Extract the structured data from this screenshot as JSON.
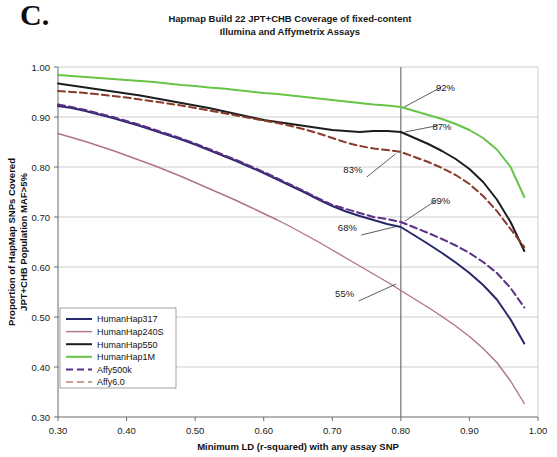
{
  "panel_letter": "C.",
  "chart_data": {
    "type": "line",
    "title": "Hapmap Build 22 JPT+CHB Coverage of fixed-content Illumina and Affymetrix Assays",
    "title_lines": [
      "Hapmap Build 22 JPT+CHB Coverage of fixed-content",
      "Illumina and Affymetrix Assays"
    ],
    "xlabel": "Minimum LD (r-squared) with any assay SNP",
    "ylabel": "Proportion of HapMap SNPs Covered JPT+CHB Population MAF>5%",
    "ylabel_lines": [
      "Proportion of HapMap SNPs Covered",
      "JPT+CHB Population MAF>5%"
    ],
    "xlim": [
      0.3,
      1.0
    ],
    "ylim": [
      0.3,
      1.0
    ],
    "xticks": [
      0.3,
      0.4,
      0.5,
      0.6,
      0.7,
      0.8,
      0.9,
      1.0
    ],
    "yticks": [
      0.3,
      0.4,
      0.5,
      0.6,
      0.7,
      0.8,
      0.9,
      1.0
    ],
    "xtick_labels": [
      "0.30",
      "0.40",
      "0.50",
      "0.60",
      "0.70",
      "0.80",
      "0.90",
      "1.00"
    ],
    "ytick_labels": [
      "0.30",
      "0.40",
      "0.50",
      "0.60",
      "0.70",
      "0.80",
      "0.90",
      "1.00"
    ],
    "grid": "horizontal",
    "legend_position": "lower-left",
    "reference_line": {
      "axis": "x",
      "value": 0.8,
      "color": "#555555"
    },
    "series": [
      {
        "name": "HumanHap317",
        "color": "#27276b",
        "style": "solid",
        "width": 2.0,
        "x": [
          0.3,
          0.32,
          0.34,
          0.36,
          0.38,
          0.4,
          0.42,
          0.44,
          0.46,
          0.48,
          0.5,
          0.52,
          0.54,
          0.56,
          0.58,
          0.6,
          0.62,
          0.64,
          0.66,
          0.68,
          0.7,
          0.72,
          0.74,
          0.76,
          0.78,
          0.8,
          0.82,
          0.84,
          0.86,
          0.88,
          0.9,
          0.92,
          0.94,
          0.96,
          0.98
        ],
        "y": [
          0.922,
          0.918,
          0.912,
          0.905,
          0.898,
          0.89,
          0.882,
          0.873,
          0.864,
          0.855,
          0.845,
          0.834,
          0.823,
          0.812,
          0.8,
          0.788,
          0.775,
          0.762,
          0.749,
          0.735,
          0.722,
          0.711,
          0.702,
          0.694,
          0.686,
          0.68,
          0.663,
          0.646,
          0.628,
          0.609,
          0.588,
          0.564,
          0.535,
          0.495,
          0.447
        ]
      },
      {
        "name": "HumanHap240S",
        "color": "#b0718f",
        "style": "solid",
        "width": 1.4,
        "x": [
          0.3,
          0.32,
          0.34,
          0.36,
          0.38,
          0.4,
          0.42,
          0.44,
          0.46,
          0.48,
          0.5,
          0.52,
          0.54,
          0.56,
          0.58,
          0.6,
          0.62,
          0.64,
          0.66,
          0.68,
          0.7,
          0.72,
          0.74,
          0.76,
          0.78,
          0.8,
          0.82,
          0.84,
          0.86,
          0.88,
          0.9,
          0.92,
          0.94,
          0.96,
          0.98
        ],
        "y": [
          0.867,
          0.859,
          0.851,
          0.842,
          0.833,
          0.823,
          0.813,
          0.803,
          0.792,
          0.781,
          0.769,
          0.757,
          0.745,
          0.733,
          0.72,
          0.707,
          0.694,
          0.68,
          0.665,
          0.65,
          0.634,
          0.618,
          0.602,
          0.586,
          0.57,
          0.553,
          0.536,
          0.519,
          0.501,
          0.482,
          0.461,
          0.437,
          0.409,
          0.372,
          0.327
        ]
      },
      {
        "name": "HumanHap550",
        "color": "#1d1d1d",
        "style": "solid",
        "width": 2.0,
        "x": [
          0.3,
          0.32,
          0.34,
          0.36,
          0.38,
          0.4,
          0.42,
          0.44,
          0.46,
          0.48,
          0.5,
          0.52,
          0.54,
          0.56,
          0.58,
          0.6,
          0.62,
          0.64,
          0.66,
          0.68,
          0.7,
          0.72,
          0.74,
          0.76,
          0.78,
          0.8,
          0.82,
          0.84,
          0.86,
          0.88,
          0.9,
          0.92,
          0.94,
          0.96,
          0.98
        ],
        "y": [
          0.967,
          0.963,
          0.959,
          0.955,
          0.951,
          0.947,
          0.943,
          0.938,
          0.933,
          0.928,
          0.923,
          0.918,
          0.912,
          0.906,
          0.9,
          0.894,
          0.89,
          0.886,
          0.882,
          0.878,
          0.874,
          0.872,
          0.87,
          0.872,
          0.872,
          0.87,
          0.858,
          0.846,
          0.832,
          0.816,
          0.796,
          0.77,
          0.735,
          0.69,
          0.632
        ]
      },
      {
        "name": "HumanHap1M",
        "color": "#66c447",
        "style": "solid",
        "width": 2.0,
        "x": [
          0.3,
          0.32,
          0.34,
          0.36,
          0.38,
          0.4,
          0.42,
          0.44,
          0.46,
          0.48,
          0.5,
          0.52,
          0.54,
          0.56,
          0.58,
          0.6,
          0.62,
          0.64,
          0.66,
          0.68,
          0.7,
          0.72,
          0.74,
          0.76,
          0.78,
          0.8,
          0.82,
          0.84,
          0.86,
          0.88,
          0.9,
          0.92,
          0.94,
          0.96,
          0.98
        ],
        "y": [
          0.984,
          0.982,
          0.98,
          0.978,
          0.976,
          0.974,
          0.972,
          0.97,
          0.967,
          0.964,
          0.962,
          0.959,
          0.957,
          0.954,
          0.951,
          0.948,
          0.946,
          0.943,
          0.94,
          0.937,
          0.934,
          0.931,
          0.928,
          0.925,
          0.923,
          0.92,
          0.912,
          0.904,
          0.896,
          0.886,
          0.874,
          0.858,
          0.835,
          0.8,
          0.74
        ]
      },
      {
        "name": "Affy500k",
        "color": "#5b2f84",
        "style": "dashed",
        "width": 2.0,
        "x": [
          0.3,
          0.32,
          0.34,
          0.36,
          0.38,
          0.4,
          0.42,
          0.44,
          0.46,
          0.48,
          0.5,
          0.52,
          0.54,
          0.56,
          0.58,
          0.6,
          0.62,
          0.64,
          0.66,
          0.68,
          0.7,
          0.72,
          0.74,
          0.76,
          0.78,
          0.8,
          0.82,
          0.84,
          0.86,
          0.88,
          0.9,
          0.92,
          0.94,
          0.96,
          0.98
        ],
        "y": [
          0.925,
          0.92,
          0.914,
          0.907,
          0.9,
          0.892,
          0.884,
          0.875,
          0.866,
          0.857,
          0.847,
          0.836,
          0.825,
          0.814,
          0.802,
          0.79,
          0.777,
          0.764,
          0.751,
          0.737,
          0.724,
          0.716,
          0.708,
          0.7,
          0.696,
          0.69,
          0.679,
          0.668,
          0.656,
          0.643,
          0.628,
          0.61,
          0.588,
          0.558,
          0.519
        ]
      },
      {
        "name": "Affy6.0",
        "color": "#8b3a2a",
        "style": "dashed",
        "width": 2.0,
        "x": [
          0.3,
          0.32,
          0.34,
          0.36,
          0.38,
          0.4,
          0.42,
          0.44,
          0.46,
          0.48,
          0.5,
          0.52,
          0.54,
          0.56,
          0.58,
          0.6,
          0.62,
          0.64,
          0.66,
          0.68,
          0.7,
          0.72,
          0.74,
          0.76,
          0.78,
          0.8,
          0.82,
          0.84,
          0.86,
          0.88,
          0.9,
          0.92,
          0.94,
          0.96,
          0.98
        ],
        "y": [
          0.952,
          0.95,
          0.948,
          0.945,
          0.942,
          0.939,
          0.935,
          0.931,
          0.927,
          0.923,
          0.918,
          0.913,
          0.908,
          0.903,
          0.898,
          0.893,
          0.888,
          0.882,
          0.875,
          0.867,
          0.858,
          0.849,
          0.842,
          0.837,
          0.834,
          0.83,
          0.82,
          0.81,
          0.798,
          0.784,
          0.766,
          0.742,
          0.712,
          0.676,
          0.64
        ]
      }
    ],
    "annotations": [
      {
        "label": "92%",
        "x": 0.865,
        "y": 0.952,
        "tip_x": 0.805,
        "tip_y": 0.92
      },
      {
        "label": "87%",
        "x": 0.86,
        "y": 0.875,
        "tip_x": 0.806,
        "tip_y": 0.87
      },
      {
        "label": "83%",
        "x": 0.73,
        "y": 0.788,
        "tip_x": 0.792,
        "tip_y": 0.826
      },
      {
        "label": "69%",
        "x": 0.858,
        "y": 0.726,
        "tip_x": 0.806,
        "tip_y": 0.692
      },
      {
        "label": "68%",
        "x": 0.722,
        "y": 0.672,
        "tip_x": 0.793,
        "tip_y": 0.681
      },
      {
        "label": "55%",
        "x": 0.718,
        "y": 0.54,
        "tip_x": 0.793,
        "tip_y": 0.566
      }
    ],
    "legend": [
      {
        "label": "HumanHap317",
        "color": "#27276b",
        "style": "solid",
        "width": 2.0
      },
      {
        "label": "HumanHap240S",
        "color": "#b0718f",
        "style": "solid",
        "width": 1.4
      },
      {
        "label": "HumanHap550",
        "color": "#1d1d1d",
        "style": "solid",
        "width": 2.0
      },
      {
        "label": "HumanHap1M",
        "color": "#66c447",
        "style": "solid",
        "width": 2.0
      },
      {
        "label": "Affy500k",
        "color": "#5b2f84",
        "style": "dashed",
        "width": 2.0
      },
      {
        "label": "Affy6.0",
        "color": "#c0806c",
        "style": "dashed",
        "width": 1.4
      }
    ]
  }
}
